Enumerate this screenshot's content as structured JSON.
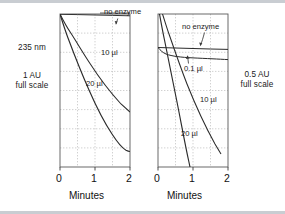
{
  "figure": {
    "background_color": "#ffffff",
    "rule_color": "#c9cdd2",
    "curve_color": "#2b2b2b",
    "grid_color": "#b8b8b8",
    "frame_color": "#555555"
  },
  "left_annotation": {
    "wavelength": "235 nm",
    "scale_line1": "1 AU",
    "scale_line2": "full scale"
  },
  "right_annotation": {
    "scale_line1": "0.5 AU",
    "scale_line2": "full scale"
  },
  "panels": [
    {
      "id": "left-panel",
      "name": "panel-235nm-1au",
      "xlabel": "Minutes",
      "xticks": [
        "0",
        "1",
        "2"
      ],
      "xtick_values": [
        0,
        1,
        2
      ],
      "xlim": [
        0,
        2
      ],
      "ylim": [
        0,
        1
      ],
      "y_full_scale": "1 AU",
      "grid": {
        "x_divisions": 4,
        "y_divisions": 8
      },
      "annotations": [
        {
          "name": "no-enzyme-label",
          "text": "no enzyme",
          "arrow": "down-left"
        },
        {
          "name": "ten-microliter-label",
          "text": "10 µl"
        },
        {
          "name": "twenty-microliter-label",
          "text": "20 µl"
        }
      ],
      "series": [
        {
          "name": "no enzyme",
          "label": "no enzyme",
          "style": "flat",
          "points": [
            [
              0.0,
              1.0
            ],
            [
              0.25,
              0.998
            ],
            [
              0.5,
              0.996
            ],
            [
              1.0,
              0.993
            ],
            [
              1.5,
              0.99
            ],
            [
              2.0,
              0.988
            ]
          ]
        },
        {
          "name": "10 µl",
          "label": "10 µl",
          "style": "gentle-decay",
          "points": [
            [
              0.0,
              1.0
            ],
            [
              0.1,
              0.962
            ],
            [
              0.25,
              0.912
            ],
            [
              0.5,
              0.838
            ],
            [
              0.75,
              0.772
            ],
            [
              1.0,
              0.712
            ],
            [
              1.25,
              0.658
            ],
            [
              1.5,
              0.608
            ],
            [
              1.75,
              0.562
            ],
            [
              2.0,
              0.52
            ]
          ]
        },
        {
          "name": "20 µl",
          "label": "20 µl",
          "style": "steep-decay-plateau",
          "points": [
            [
              0.0,
              1.0
            ],
            [
              0.1,
              0.928
            ],
            [
              0.25,
              0.832
            ],
            [
              0.5,
              0.692
            ],
            [
              0.75,
              0.562
            ],
            [
              1.0,
              0.432
            ],
            [
              1.2,
              0.332
            ],
            [
              1.4,
              0.236
            ],
            [
              1.55,
              0.172
            ],
            [
              1.68,
              0.128
            ],
            [
              1.8,
              0.108
            ],
            [
              1.9,
              0.1
            ],
            [
              2.0,
              0.098
            ]
          ]
        }
      ]
    },
    {
      "id": "right-panel",
      "name": "panel-0p5au",
      "xlabel": "Minutes",
      "xticks": [
        "0",
        "1",
        "2"
      ],
      "xtick_values": [
        0,
        1,
        2
      ],
      "xlim": [
        0,
        2
      ],
      "ylim": [
        0,
        1
      ],
      "y_full_scale": "0.5 AU",
      "grid": {
        "x_divisions": 4,
        "y_divisions": 8
      },
      "annotations": [
        {
          "name": "no-enzyme-label",
          "text": "no enzyme",
          "arrow": "curved-down"
        },
        {
          "name": "point-one-microliter-label",
          "text": "0.1 µl",
          "arrow": "up"
        },
        {
          "name": "ten-microliter-label",
          "text": "10 µl"
        },
        {
          "name": "twenty-microliter-label",
          "text": "20 µl"
        }
      ],
      "series": [
        {
          "name": "no enzyme",
          "label": "no enzyme",
          "style": "flat",
          "points": [
            [
              0.0,
              0.78
            ],
            [
              0.5,
              0.776
            ],
            [
              1.0,
              0.772
            ],
            [
              1.5,
              0.768
            ],
            [
              2.0,
              0.765
            ]
          ]
        },
        {
          "name": "0.1 µl",
          "label": "0.1 µl",
          "style": "slight-decay",
          "points": [
            [
              0.0,
              0.78
            ],
            [
              0.15,
              0.745
            ],
            [
              0.35,
              0.726
            ],
            [
              0.7,
              0.714
            ],
            [
              1.2,
              0.702
            ],
            [
              1.6,
              0.694
            ],
            [
              2.0,
              0.688
            ]
          ]
        },
        {
          "name": "10 µl",
          "label": "10 µl",
          "style": "steep-linear",
          "points": [
            [
              0.0,
              1.0
            ],
            [
              0.1,
              0.93
            ],
            [
              0.25,
              0.845
            ],
            [
              0.5,
              0.72
            ],
            [
              0.75,
              0.6
            ],
            [
              1.0,
              0.485
            ],
            [
              1.25,
              0.375
            ],
            [
              1.5,
              0.275
            ],
            [
              1.75,
              0.185
            ],
            [
              2.0,
              0.105
            ]
          ]
        },
        {
          "name": "20 µl",
          "label": "20 µl",
          "style": "very-steep-linear",
          "points": [
            [
              0.0,
              1.0
            ],
            [
              0.1,
              0.875
            ],
            [
              0.25,
              0.72
            ],
            [
              0.4,
              0.575
            ],
            [
              0.6,
              0.4
            ],
            [
              0.8,
              0.235
            ],
            [
              1.0,
              0.09
            ],
            [
              1.12,
              0.0
            ]
          ]
        }
      ]
    }
  ]
}
